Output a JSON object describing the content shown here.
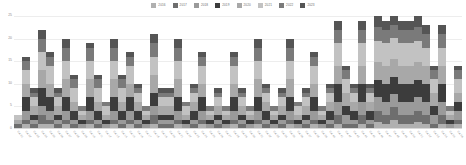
{
  "chart_data": {
    "type": "bar",
    "stacked": true,
    "title": "",
    "subtitle": "",
    "xlabel": "",
    "ylabel": "",
    "ylim": [
      0,
      25
    ],
    "yticks": [
      0,
      5,
      10,
      15,
      20,
      25
    ],
    "ytick_labels": [
      "0",
      "5",
      "10",
      "15",
      "20",
      "25"
    ],
    "grid": true,
    "legend_position": "top-center",
    "series_colors": [
      "#b0b0b0",
      "#6e6e6e",
      "#9a9a9a",
      "#3c3c3c",
      "#a8a8a8",
      "#c2c2c2",
      "#7a7a7a",
      "#555555"
    ],
    "series": [
      {
        "name": "2016",
        "color": "#b0b0b0",
        "values": [
          0,
          1,
          0,
          1,
          1,
          0,
          1,
          0,
          0,
          1,
          0,
          0,
          1,
          0,
          1,
          0,
          0,
          1,
          0,
          0,
          1,
          0,
          0,
          1,
          0,
          0,
          0,
          1,
          0,
          0,
          1,
          0,
          0,
          0,
          1,
          0,
          0,
          1,
          0,
          0,
          1,
          0,
          0,
          1,
          0,
          2,
          1,
          2,
          1,
          1,
          2,
          1,
          0,
          1,
          0,
          1
        ]
      },
      {
        "name": "2017",
        "color": "#6e6e6e",
        "values": [
          1,
          1,
          1,
          2,
          1,
          1,
          1,
          1,
          0,
          1,
          1,
          0,
          1,
          1,
          1,
          1,
          0,
          2,
          1,
          1,
          1,
          0,
          1,
          1,
          0,
          1,
          0,
          1,
          1,
          0,
          1,
          1,
          0,
          1,
          1,
          0,
          1,
          1,
          0,
          1,
          2,
          1,
          1,
          2,
          1,
          3,
          2,
          3,
          2,
          2,
          3,
          2,
          1,
          2,
          0,
          1
        ]
      },
      {
        "name": "2018",
        "color": "#9a9a9a",
        "values": [
          0,
          2,
          1,
          2,
          2,
          1,
          2,
          1,
          1,
          2,
          1,
          1,
          2,
          1,
          2,
          1,
          1,
          2,
          1,
          1,
          2,
          1,
          1,
          2,
          1,
          1,
          1,
          2,
          1,
          1,
          2,
          1,
          1,
          1,
          2,
          1,
          1,
          2,
          1,
          1,
          3,
          2,
          1,
          3,
          1,
          4,
          3,
          3,
          3,
          3,
          4,
          3,
          2,
          3,
          1,
          2
        ]
      },
      {
        "name": "2019",
        "color": "#3c3c3c",
        "values": [
          0,
          3,
          1,
          4,
          3,
          1,
          3,
          2,
          1,
          3,
          2,
          1,
          3,
          2,
          3,
          2,
          1,
          3,
          1,
          1,
          3,
          1,
          2,
          3,
          1,
          1,
          1,
          3,
          1,
          1,
          3,
          2,
          1,
          1,
          3,
          1,
          1,
          3,
          1,
          2,
          4,
          2,
          2,
          4,
          2,
          5,
          4,
          4,
          4,
          4,
          5,
          4,
          2,
          4,
          1,
          2
        ]
      },
      {
        "name": "2020",
        "color": "#a8a8a8",
        "values": [
          1,
          3,
          2,
          4,
          3,
          2,
          4,
          2,
          1,
          4,
          2,
          1,
          4,
          2,
          3,
          2,
          1,
          4,
          2,
          2,
          4,
          1,
          2,
          3,
          1,
          2,
          1,
          3,
          2,
          1,
          4,
          2,
          1,
          2,
          4,
          1,
          2,
          3,
          1,
          2,
          4,
          3,
          2,
          4,
          2,
          5,
          4,
          4,
          4,
          4,
          5,
          4,
          3,
          4,
          1,
          2
        ]
      },
      {
        "name": "2021",
        "color": "#c2c2c2",
        "values": [
          1,
          3,
          2,
          4,
          4,
          2,
          4,
          3,
          1,
          4,
          3,
          2,
          4,
          3,
          4,
          2,
          1,
          4,
          2,
          2,
          4,
          2,
          2,
          4,
          1,
          2,
          1,
          4,
          2,
          1,
          4,
          2,
          1,
          2,
          4,
          2,
          2,
          4,
          1,
          2,
          5,
          3,
          2,
          5,
          2,
          6,
          5,
          5,
          5,
          5,
          6,
          4,
          3,
          4,
          1,
          3
        ]
      },
      {
        "name": "2022",
        "color": "#7a7a7a",
        "values": [
          0,
          2,
          1,
          3,
          2,
          1,
          3,
          2,
          1,
          3,
          2,
          1,
          3,
          2,
          2,
          1,
          1,
          3,
          1,
          1,
          3,
          1,
          1,
          2,
          1,
          1,
          1,
          2,
          1,
          1,
          3,
          1,
          1,
          1,
          3,
          1,
          1,
          2,
          1,
          1,
          3,
          2,
          1,
          3,
          1,
          4,
          3,
          3,
          3,
          3,
          4,
          3,
          2,
          3,
          1,
          2
        ]
      },
      {
        "name": "2023",
        "color": "#555555",
        "values": [
          0,
          1,
          1,
          2,
          1,
          1,
          2,
          1,
          0,
          1,
          1,
          0,
          2,
          1,
          1,
          1,
          0,
          2,
          1,
          1,
          2,
          0,
          1,
          1,
          0,
          1,
          0,
          1,
          1,
          0,
          2,
          1,
          0,
          1,
          2,
          0,
          1,
          1,
          0,
          1,
          2,
          1,
          1,
          2,
          1,
          3,
          2,
          2,
          2,
          2,
          3,
          2,
          1,
          2,
          0,
          1
        ]
      }
    ],
    "categories": [
      "Cat 01",
      "Cat 02",
      "Cat 03",
      "Cat 04",
      "Cat 05",
      "Cat 06",
      "Cat 07",
      "Cat 08",
      "Cat 09",
      "Cat 10",
      "Cat 11",
      "Cat 12",
      "Cat 13",
      "Cat 14",
      "Cat 15",
      "Cat 16",
      "Cat 17",
      "Cat 18",
      "Cat 19",
      "Cat 20",
      "Cat 21",
      "Cat 22",
      "Cat 23",
      "Cat 24",
      "Cat 25",
      "Cat 26",
      "Cat 27",
      "Cat 28",
      "Cat 29",
      "Cat 30",
      "Cat 31",
      "Cat 32",
      "Cat 33",
      "Cat 34",
      "Cat 35",
      "Cat 36",
      "Cat 37",
      "Cat 38",
      "Cat 39",
      "Cat 40",
      "Cat 41",
      "Cat 42",
      "Cat 43",
      "Cat 44",
      "Cat 45",
      "Cat 46",
      "Cat 47",
      "Cat 48",
      "Cat 49",
      "Cat 50",
      "Cat 51",
      "Cat 52",
      "Cat 53",
      "Cat 54",
      "Cat 55",
      "Cat 56"
    ],
    "totals": [
      3,
      16,
      9,
      22,
      17,
      9,
      20,
      12,
      5,
      19,
      12,
      6,
      20,
      12,
      17,
      10,
      5,
      21,
      9,
      9,
      20,
      6,
      10,
      17,
      5,
      9,
      5,
      17,
      9,
      5,
      20,
      10,
      5,
      9,
      20,
      6,
      9,
      17,
      5,
      10,
      23,
      14,
      10,
      24,
      10,
      32,
      24,
      26,
      24,
      24,
      32,
      23,
      14,
      23,
      5,
      14
    ]
  }
}
